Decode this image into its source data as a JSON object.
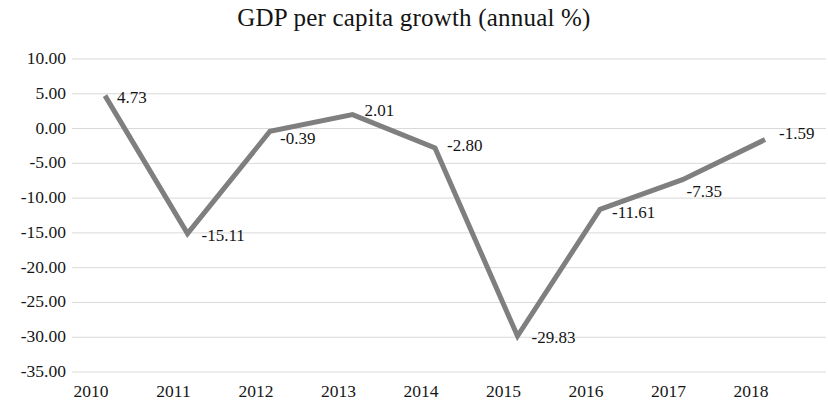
{
  "chart_data": {
    "type": "line",
    "title": "GDP per capita growth (annual %)",
    "xlabel": "",
    "ylabel": "",
    "categories": [
      "2010",
      "2011",
      "2012",
      "2013",
      "2014",
      "2015",
      "2016",
      "2017",
      "2018"
    ],
    "values": [
      4.73,
      -15.11,
      -0.39,
      2.01,
      -2.8,
      -29.83,
      -11.61,
      -7.35,
      -1.59
    ],
    "point_labels": [
      "4.73",
      "-15.11",
      "-0.39",
      "2.01",
      "-2.80",
      "-29.83",
      "-11.61",
      "-7.35",
      "-1.59"
    ],
    "ylim": [
      -35.0,
      10.0
    ],
    "y_ticks": [
      10.0,
      5.0,
      0.0,
      -5.0,
      -10.0,
      -15.0,
      -20.0,
      -25.0,
      -30.0,
      -35.0
    ],
    "y_tick_labels": [
      "10.00",
      "5.00",
      "0.00",
      "-5.00",
      "-10.00",
      "-15.00",
      "-20.00",
      "-25.00",
      "-30.00",
      "-35.00"
    ],
    "grid": true,
    "grid_axis": "y",
    "legend": false,
    "legend_position": "none",
    "series": [
      {
        "name": "GDP per capita growth (annual %)",
        "values": [
          4.73,
          -15.11,
          -0.39,
          2.01,
          -2.8,
          -29.83,
          -11.61,
          -7.35,
          -1.59
        ]
      }
    ],
    "colors": {
      "line": "#7f7f7f",
      "grid": "#d9d9d9",
      "text": "#161616",
      "background": "#ffffff"
    },
    "line_width": 5,
    "markers": false
  }
}
